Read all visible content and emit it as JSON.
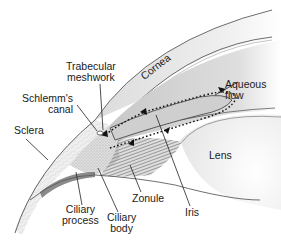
{
  "diagram": {
    "labels": {
      "trabecular_meshwork": [
        "Trabecular",
        "meshwork"
      ],
      "schlemms_canal": [
        "Schlemm's",
        "canal"
      ],
      "sclera": "Sclera",
      "cornea": "Cornea",
      "aqueous_flow": [
        "Aqueous",
        "flow"
      ],
      "lens": "Lens",
      "ciliary_process": [
        "Ciliary",
        "process"
      ],
      "ciliary_body": [
        "Ciliary",
        "body"
      ],
      "zonule": "Zonule",
      "iris": "Iris"
    },
    "colors": {
      "outline": "#4a4a4a",
      "cornea_fill": "#ededed",
      "chamber_fill": "#d6d6d6",
      "sclera_fill": "#e2e2e2",
      "ciliary_fill": "#9a9a9a",
      "lens_fill": "#f7f7f7",
      "label_text": "#1a1a1a",
      "flow_arrows": "#111111"
    }
  }
}
